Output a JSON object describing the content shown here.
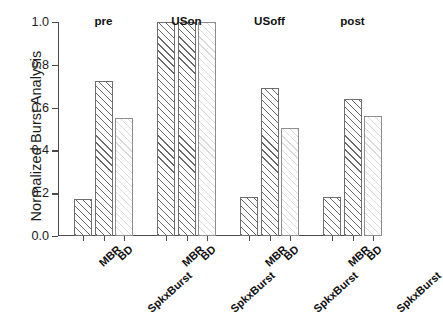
{
  "chart_data": {
    "type": "bar",
    "title": "",
    "xlabel": "",
    "ylabel": "Normalized Burst Analysis",
    "ylim": [
      0.0,
      1.0
    ],
    "ytick_labels": [
      "0.0",
      "0.2",
      "0.4",
      "0.6",
      "0.8",
      "1.0"
    ],
    "ytick_values": [
      0.0,
      0.2,
      0.4,
      0.6,
      0.8,
      1.0
    ],
    "grid": false,
    "legend": "none",
    "group_labels": [
      "pre",
      "USon",
      "USoff",
      "post"
    ],
    "categories": [
      "MBR",
      "BD",
      "SpkxBurst"
    ],
    "groups": [
      {
        "name": "pre",
        "values": [
          0.175,
          0.725,
          0.55
        ]
      },
      {
        "name": "USon",
        "values": [
          1.0,
          1.0,
          1.0
        ]
      },
      {
        "name": "USoff",
        "values": [
          0.18,
          0.69,
          0.505
        ]
      },
      {
        "name": "post",
        "values": [
          0.18,
          0.64,
          0.56
        ]
      }
    ],
    "series_styles": [
      "hatch-dark",
      "hatch-dark",
      "hatch-light"
    ],
    "colors": {
      "bar_edge": "#6e6e6e",
      "bar_face": "#ffffff",
      "hatch_dark": "#505050",
      "hatch_light": "#969696",
      "axis": "#4a4a4a",
      "text": "#1b1b1b"
    }
  }
}
